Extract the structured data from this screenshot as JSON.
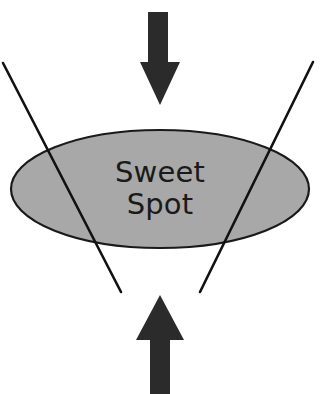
{
  "canvas": {
    "width": 321,
    "height": 394,
    "background_color": "#ffffff"
  },
  "diagram": {
    "title": "Sweet Spot",
    "type": "conceptual-converging-forces",
    "ellipse": {
      "label_line_1": "Sweet",
      "label_line_2": "Spot",
      "fill_color": "#a8a8a8",
      "stroke_color": "#1a1a1a",
      "stroke_width": 2.2,
      "center_x": 160,
      "center_y": 189,
      "radius_x": 149,
      "radius_y": 59,
      "text_color": "#1a1a1a"
    },
    "arrows": [
      {
        "name": "top-arrow",
        "direction": "down",
        "color": "#2b2b2b",
        "shaft_left": 148,
        "shaft_right": 168,
        "shaft_top": 12,
        "head_base_y": 62,
        "head_left": 140,
        "head_right": 180,
        "tip_x": 160,
        "tip_y": 105
      },
      {
        "name": "bottom-arrow",
        "direction": "up",
        "color": "#2b2b2b",
        "shaft_left": 150,
        "shaft_right": 170,
        "shaft_bottom": 394,
        "head_base_y": 340,
        "head_left": 136,
        "head_right": 184,
        "tip_x": 160,
        "tip_y": 295
      }
    ],
    "lines": [
      {
        "name": "left-diagonal-line",
        "color": "#111111",
        "width": 2.6,
        "x1": 3,
        "y1": 63,
        "x2": 121,
        "y2": 292
      },
      {
        "name": "right-diagonal-line",
        "color": "#111111",
        "width": 2.6,
        "x1": 313,
        "y1": 62,
        "x2": 200,
        "y2": 292
      }
    ]
  }
}
